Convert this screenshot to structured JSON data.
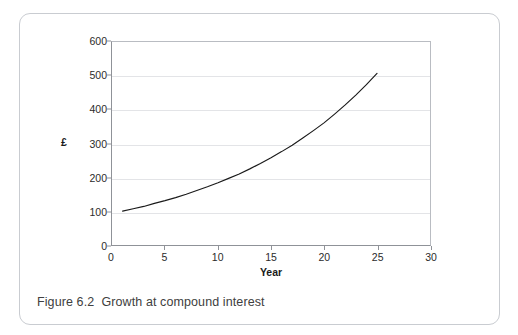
{
  "figure": {
    "caption": "Figure 6.2  Growth at compound interest"
  },
  "chart_data": {
    "type": "line",
    "title": "",
    "xlabel": "Year",
    "ylabel": "£",
    "xlim": [
      0,
      30
    ],
    "ylim": [
      0,
      600
    ],
    "xticks": [
      0,
      5,
      10,
      15,
      20,
      25,
      30
    ],
    "xtick_labels": [
      "0",
      "5",
      "10",
      "15",
      "20",
      "25",
      "30"
    ],
    "yticks": [
      0,
      100,
      200,
      300,
      400,
      500,
      600
    ],
    "ytick_labels": [
      "0",
      "100",
      "200",
      "300",
      "400",
      "500",
      "600"
    ],
    "grid": "horizontal",
    "legend": "none",
    "line_color": "#1a1a1a",
    "gridline_color": "#e3e4e7",
    "axis_color": "#8f9298",
    "series": [
      {
        "name": "Compound interest growth",
        "x": [
          1,
          2,
          3,
          4,
          5,
          6,
          7,
          8,
          9,
          10,
          11,
          12,
          13,
          14,
          15,
          16,
          17,
          18,
          19,
          20,
          21,
          22,
          23,
          24,
          25
        ],
        "values": [
          100,
          107,
          114,
          123,
          131,
          140,
          150,
          161,
          172,
          184,
          197,
          210,
          225,
          241,
          258,
          276,
          295,
          316,
          338,
          361,
          387,
          414,
          443,
          474,
          507
        ]
      }
    ]
  }
}
